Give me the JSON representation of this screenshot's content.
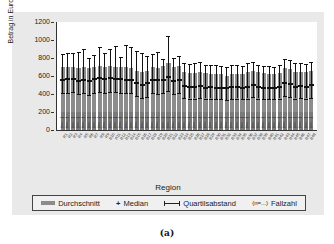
{
  "chart_data": {
    "type": "bar",
    "title": "",
    "xlabel": "Region",
    "ylabel": "Betrag in Euro pro Monat",
    "ylim": [
      0,
      1200
    ],
    "yticks": [
      0,
      200,
      400,
      600,
      800,
      1000,
      1200
    ],
    "grid": false,
    "legend_position": "bottom",
    "categories": [
      "R1",
      "R2",
      "R3",
      "R4",
      "R5",
      "R6",
      "R7",
      "R8",
      "R9",
      "R10",
      "R11",
      "R12",
      "R13",
      "R14",
      "R15",
      "R16",
      "R17",
      "R18",
      "R19",
      "R20",
      "R21",
      "R22",
      "R23",
      "R24",
      "R25",
      "R26",
      "R27",
      "R28",
      "R29",
      "R30",
      "R31",
      "R32",
      "R33",
      "R34",
      "R35",
      "R36",
      "R37",
      "R38",
      "R39",
      "R40",
      "R41",
      "R42",
      "R43",
      "R44",
      "R45",
      "R46",
      "R47",
      "R48"
    ],
    "series": [
      {
        "name": "Durchschnitt",
        "values": [
          700,
          700,
          705,
          690,
          700,
          690,
          705,
          710,
          700,
          710,
          700,
          700,
          700,
          690,
          660,
          640,
          660,
          700,
          690,
          710,
          740,
          700,
          710,
          640,
          630,
          630,
          650,
          630,
          620,
          620,
          620,
          600,
          620,
          620,
          620,
          640,
          660,
          640,
          630,
          620,
          620,
          630,
          690,
          680,
          640,
          650,
          640,
          660
        ]
      },
      {
        "name": "Median",
        "values": [
          560,
          565,
          570,
          550,
          560,
          540,
          565,
          575,
          565,
          580,
          570,
          570,
          560,
          560,
          520,
          500,
          520,
          560,
          555,
          560,
          590,
          550,
          560,
          490,
          480,
          480,
          490,
          470,
          480,
          470,
          470,
          470,
          480,
          480,
          470,
          480,
          500,
          480,
          470,
          470,
          470,
          480,
          520,
          510,
          480,
          490,
          480,
          500
        ]
      },
      {
        "name": "Quartilsabstand_unten",
        "values": [
          410,
          415,
          420,
          400,
          410,
          390,
          415,
          420,
          415,
          425,
          420,
          415,
          410,
          410,
          380,
          360,
          370,
          410,
          405,
          410,
          430,
          400,
          410,
          360,
          350,
          350,
          360,
          350,
          350,
          340,
          340,
          330,
          340,
          350,
          340,
          350,
          370,
          350,
          340,
          340,
          340,
          350,
          380,
          370,
          350,
          360,
          350,
          360
        ]
      },
      {
        "name": "Quartilsabstand_oben",
        "values": [
          840,
          855,
          855,
          870,
          900,
          800,
          830,
          920,
          855,
          905,
          930,
          810,
          950,
          920,
          880,
          860,
          820,
          850,
          870,
          790,
          1050,
          800,
          820,
          750,
          730,
          740,
          760,
          720,
          720,
          720,
          710,
          700,
          720,
          720,
          710,
          740,
          760,
          720,
          710,
          710,
          700,
          720,
          790,
          780,
          740,
          750,
          730,
          760
        ]
      }
    ],
    "annotations": [
      "(n=...) Fallzahl labels inside bars (unreadable)"
    ]
  },
  "axis": {
    "ylabel": "Betrag in Euro pro Monat",
    "xlabel": "Region",
    "ticks": [
      "0",
      "200",
      "400",
      "600",
      "800",
      "1000",
      "1200"
    ]
  },
  "legend": {
    "mean": "Durchschnitt",
    "median": "Median",
    "iqr": "Quartilsabstand",
    "n_prefix": "(n=...)",
    "n": "Fallzahl"
  },
  "caption": "(a)"
}
